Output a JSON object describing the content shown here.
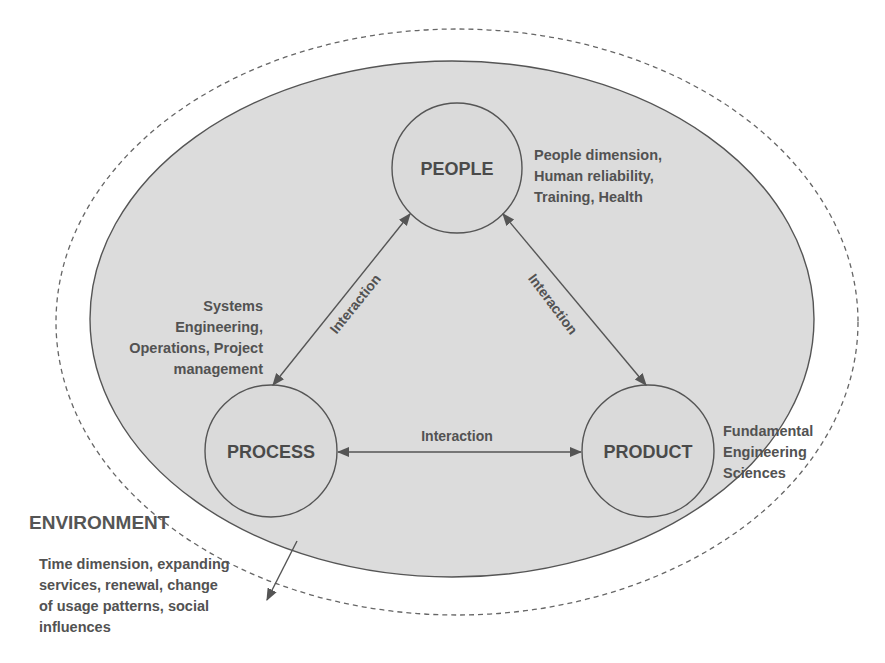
{
  "colors": {
    "background": "#ffffff",
    "system_fill": "#dcdcdc",
    "stroke": "#555555",
    "text": "#4f4f4f"
  },
  "environment": {
    "title": "ENVIRONMENT",
    "description_lines": [
      "Time dimension, expanding",
      "services, renewal, change",
      "of usage patterns, social",
      "influences"
    ]
  },
  "nodes": {
    "people": {
      "label": "PEOPLE",
      "description_lines": [
        "People dimension,",
        "Human reliability,",
        "Training, Health"
      ]
    },
    "process": {
      "label": "PROCESS",
      "description_lines": [
        "Systems",
        "Engineering,",
        "Operations, Project",
        "management"
      ]
    },
    "product": {
      "label": "PRODUCT",
      "description_lines": [
        "Fundamental",
        "Engineering",
        "Sciences"
      ]
    }
  },
  "edges": {
    "people_process": {
      "label": "Interaction"
    },
    "people_product": {
      "label": "Interaction"
    },
    "process_product": {
      "label": "Interaction"
    }
  }
}
